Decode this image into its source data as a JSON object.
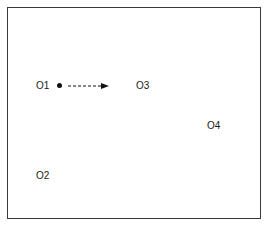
{
  "diagram": {
    "objects": [
      {
        "id": "o1",
        "label": "O1"
      },
      {
        "id": "o2",
        "label": "O2"
      },
      {
        "id": "o3",
        "label": "O3"
      },
      {
        "id": "o4",
        "label": "O4"
      }
    ],
    "moving_object": "O1",
    "arrow": {
      "from": "O1",
      "toward": "O3",
      "style": "dashed"
    },
    "colors": {
      "border": "#3a3a3a",
      "text": "#1a1a1a",
      "dot": "#111111",
      "background": "#ffffff"
    }
  }
}
